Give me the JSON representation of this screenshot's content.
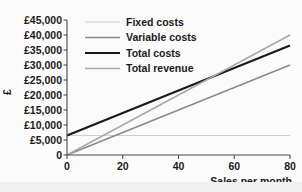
{
  "chart_data": {
    "type": "line",
    "title": "",
    "xlabel": "Sales per month",
    "ylabel": "£",
    "xlim": [
      0,
      80
    ],
    "ylim": [
      0,
      45000
    ],
    "xticks": [
      0,
      20,
      40,
      60,
      80
    ],
    "xtick_labels": [
      "0",
      "20",
      "40",
      "60",
      "80"
    ],
    "yticks": [
      0,
      5000,
      10000,
      15000,
      20000,
      25000,
      30000,
      35000,
      40000,
      45000
    ],
    "ytick_labels": [
      "0",
      "£5,000",
      "£10,000",
      "£15,000",
      "£20,000",
      "£25,000",
      "£30,000",
      "£35,000",
      "£40,000",
      "£45,000"
    ],
    "grid": false,
    "legend_position": "top-center",
    "x": [
      0,
      80
    ],
    "series": [
      {
        "name": "Fixed costs",
        "values": [
          6500,
          6500
        ],
        "color": "#cfcfcf",
        "width": 1.2
      },
      {
        "name": "Variable costs",
        "values": [
          0,
          30000
        ],
        "color": "#8a8a8a",
        "width": 1.5
      },
      {
        "name": "Total costs",
        "values": [
          6500,
          36500
        ],
        "color": "#1a1a1a",
        "width": 2.2
      },
      {
        "name": "Total revenue",
        "values": [
          0,
          40000
        ],
        "color": "#a8a8a8",
        "width": 1.5
      }
    ],
    "annotations": {
      "break_even_sales": 52,
      "break_even_value": 26000
    }
  },
  "legend": {
    "entries": [
      {
        "label": "Fixed costs"
      },
      {
        "label": "Variable costs"
      },
      {
        "label": "Total costs"
      },
      {
        "label": "Total revenue"
      }
    ]
  },
  "axes": {
    "y_axis_title": "£",
    "x_axis_title": "Sales per month"
  }
}
